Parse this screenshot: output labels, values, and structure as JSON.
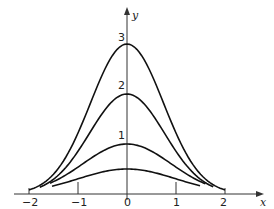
{
  "chart_data": {
    "type": "line",
    "title": "",
    "xlabel": "x",
    "ylabel": "y",
    "xlim": [
      -2,
      2
    ],
    "ylim": [
      0,
      3
    ],
    "grid": false,
    "legend": "none",
    "x_ticks": [
      "-2",
      "-1",
      "0",
      "1",
      "2"
    ],
    "y_annotations": [
      "1",
      "2",
      "3"
    ],
    "series": [
      {
        "name": "peak 3",
        "peak": 3,
        "x": [
          -2,
          -1.5,
          -1,
          -0.5,
          0,
          0.5,
          1,
          1.5,
          2
        ],
        "values": [
          0.08,
          0.4,
          1.22,
          2.4,
          3.0,
          2.4,
          1.22,
          0.4,
          0.08
        ]
      },
      {
        "name": "peak 2",
        "peak": 2,
        "x": [
          -1.78,
          -1.5,
          -1,
          -0.5,
          0,
          0.5,
          1,
          1.5,
          1.76
        ],
        "values": [
          0.14,
          0.3,
          0.85,
          1.62,
          2.0,
          1.62,
          0.85,
          0.3,
          0.14
        ]
      },
      {
        "name": "peak 1",
        "peak": 1,
        "x": [
          -1.57,
          -1,
          -0.5,
          0,
          0.5,
          1,
          1.6
        ],
        "values": [
          0.22,
          0.54,
          0.86,
          1.0,
          0.86,
          0.54,
          0.2
        ]
      },
      {
        "name": "peak 0.5",
        "peak": 0.5,
        "x": [
          -1.53,
          -1,
          -0.5,
          0,
          0.5,
          1,
          1.49
        ],
        "values": [
          0.15,
          0.3,
          0.44,
          0.5,
          0.44,
          0.3,
          0.16
        ]
      }
    ],
    "curve_params": [
      {
        "a": 3,
        "k": 0.9,
        "xmin": -2.0,
        "xmax": 2.0
      },
      {
        "a": 2,
        "k": 0.85,
        "xmin": -1.78,
        "xmax": 1.76
      },
      {
        "a": 1,
        "k": 0.62,
        "xmin": -1.57,
        "xmax": 1.6
      },
      {
        "a": 0.5,
        "k": 0.5,
        "xmin": -1.53,
        "xmax": 1.49
      }
    ]
  },
  "labels": {
    "x_axis": "x",
    "y_axis": "y",
    "x_ticks": [
      "−2",
      "−1",
      "0",
      "1",
      "2"
    ],
    "peak_labels": [
      "3",
      "2",
      "1"
    ]
  }
}
